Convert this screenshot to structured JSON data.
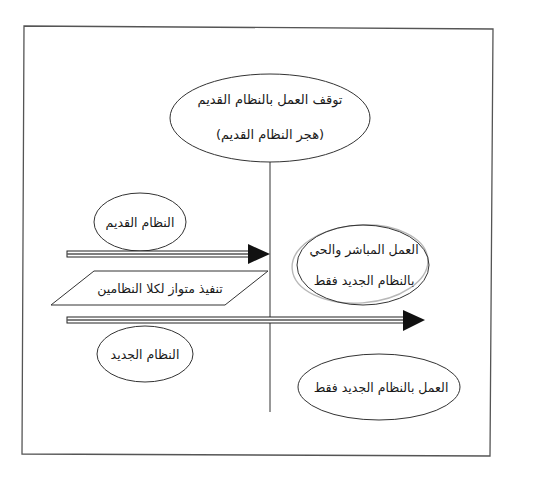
{
  "diagram": {
    "title": "",
    "nodes": {
      "stop_old": {
        "line1": "توقف العمل بالنظام القديم",
        "line2": "(هجر النظام القديم)"
      },
      "old_system": {
        "label": "النظام القديم"
      },
      "parallel": {
        "label": "تنفيذ متواز لكلا النظامين"
      },
      "new_system": {
        "label": "النظام الجديد"
      },
      "direct_live": {
        "line1": "العمل المباشر والحي",
        "line2": "بالنظام الجديد فقط"
      },
      "new_only": {
        "label": "العمل بالنظام الجديد فقط"
      }
    },
    "edges": [
      {
        "from": "old_system",
        "to": "cutover_line",
        "type": "arrow"
      },
      {
        "from": "new_system",
        "to": "direct_live",
        "type": "arrow"
      }
    ],
    "colors": {
      "stroke": "#333333",
      "frame": "#555555",
      "highlight_ring": "#b8b8b8",
      "arrow_fill": "#111111"
    }
  }
}
